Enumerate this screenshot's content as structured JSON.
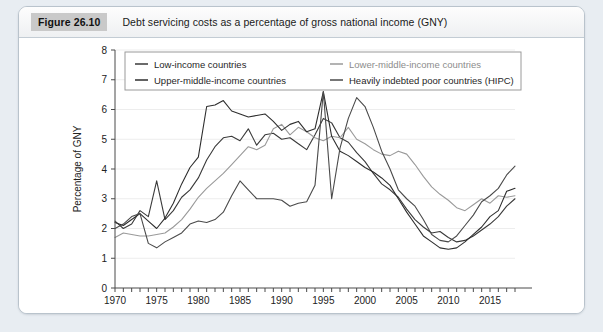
{
  "figure": {
    "badge": "Figure 26.10",
    "title": "Debt servicing costs as a percentage of gross national income (GNY)"
  },
  "chart_data": {
    "type": "line",
    "title": "Debt servicing costs as a percentage of gross national income (GNY)",
    "xlabel": "",
    "ylabel": "Percentage of GNY",
    "xlim": [
      1970,
      2018
    ],
    "ylim": [
      0,
      8
    ],
    "yticks": [
      0,
      1,
      2,
      3,
      4,
      5,
      6,
      7,
      8
    ],
    "xticks": [
      1970,
      1975,
      1980,
      1985,
      1990,
      1995,
      2000,
      2005,
      2010,
      2015
    ],
    "xtick_labels": [
      "1970",
      "1975",
      "1980",
      "1985",
      "1990",
      "1995",
      "2000",
      "2005",
      "2010",
      "2015"
    ],
    "ytick_labels": [
      "0",
      "1",
      "2",
      "3",
      "4",
      "5",
      "6",
      "7",
      "8"
    ],
    "grid": "horizontal",
    "legend_position": "top-inside",
    "x": [
      1970,
      1971,
      1972,
      1973,
      1974,
      1975,
      1976,
      1977,
      1978,
      1979,
      1980,
      1981,
      1982,
      1983,
      1984,
      1985,
      1986,
      1987,
      1988,
      1989,
      1990,
      1991,
      1992,
      1993,
      1994,
      1995,
      1996,
      1997,
      1998,
      1999,
      2000,
      2001,
      2002,
      2003,
      2004,
      2005,
      2006,
      2007,
      2008,
      2009,
      2010,
      2011,
      2012,
      2013,
      2014,
      2015,
      2016,
      2017,
      2018
    ],
    "series": [
      {
        "name": "Low-income countries",
        "color": "#3a3a3a",
        "values": [
          2.25,
          2.0,
          2.15,
          2.6,
          2.4,
          3.6,
          2.3,
          2.6,
          3.05,
          3.3,
          3.7,
          4.3,
          4.75,
          5.05,
          5.1,
          4.95,
          5.35,
          4.8,
          5.15,
          5.2,
          5.0,
          5.05,
          4.85,
          4.65,
          5.15,
          5.7,
          5.55,
          5.05,
          4.9,
          4.55,
          4.25,
          3.85,
          3.5,
          3.3,
          3.05,
          2.65,
          2.3,
          2.05,
          1.85,
          1.9,
          1.7,
          1.55,
          1.6,
          1.75,
          1.95,
          2.15,
          2.4,
          2.75,
          3.0
        ]
      },
      {
        "name": "Lower-middle-income countries",
        "color": "#9a9a9a",
        "values": [
          1.7,
          1.85,
          1.8,
          1.75,
          1.75,
          1.8,
          1.85,
          2.05,
          2.3,
          2.65,
          3.05,
          3.35,
          3.6,
          3.85,
          4.15,
          4.45,
          4.75,
          4.65,
          4.8,
          5.35,
          5.5,
          5.15,
          5.4,
          5.25,
          5.05,
          4.95,
          5.1,
          5.05,
          5.4,
          5.0,
          4.85,
          4.65,
          4.5,
          4.45,
          4.6,
          4.5,
          4.15,
          3.75,
          3.4,
          3.15,
          2.95,
          2.7,
          2.6,
          2.8,
          3.0,
          2.85,
          3.1,
          3.05,
          3.1
        ]
      },
      {
        "name": "Upper-middle-income countries",
        "color": "#2e2e2e",
        "values": [
          2.2,
          2.1,
          2.3,
          2.5,
          2.25,
          2.0,
          2.35,
          2.85,
          3.5,
          4.05,
          4.4,
          6.1,
          6.15,
          6.3,
          5.95,
          5.85,
          5.75,
          5.8,
          5.85,
          5.6,
          5.3,
          5.5,
          5.6,
          5.25,
          5.35,
          6.6,
          5.1,
          4.6,
          4.45,
          4.25,
          4.05,
          3.9,
          3.7,
          3.45,
          3.0,
          2.55,
          2.15,
          1.75,
          1.55,
          1.35,
          1.3,
          1.35,
          1.55,
          1.8,
          2.05,
          2.4,
          2.6,
          3.25,
          3.35
        ]
      },
      {
        "name": "Heavily indebted poor countries (HIPC)",
        "color": "#4a4a4a",
        "values": [
          2.0,
          2.15,
          2.4,
          2.5,
          1.5,
          1.35,
          1.55,
          1.7,
          1.85,
          2.15,
          2.25,
          2.2,
          2.3,
          2.55,
          3.1,
          3.6,
          3.3,
          3.0,
          3.0,
          3.0,
          2.95,
          2.75,
          2.85,
          2.9,
          3.45,
          6.6,
          3.0,
          4.7,
          5.7,
          6.4,
          6.1,
          5.4,
          4.6,
          4.0,
          3.3,
          3.0,
          2.75,
          2.3,
          1.8,
          1.6,
          1.55,
          1.75,
          2.1,
          2.45,
          2.9,
          3.1,
          3.35,
          3.8,
          4.1
        ]
      }
    ]
  },
  "legend": {
    "items": [
      {
        "label": "Low-income countries",
        "color": "#3a3a3a"
      },
      {
        "label": "Lower-middle-income countries",
        "color": "#9a9a9a"
      },
      {
        "label": "Upper-middle-income countries",
        "color": "#2e2e2e"
      },
      {
        "label": "Heavily indebted poor countries (HIPC)",
        "color": "#4a4a4a"
      }
    ]
  },
  "axes": {
    "y_title": "Percentage of GNY"
  }
}
